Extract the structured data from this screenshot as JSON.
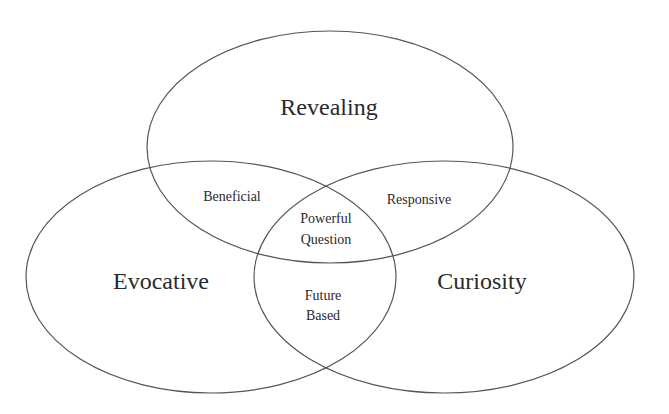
{
  "diagram": {
    "type": "venn",
    "stroke_color": "#555555",
    "text_color": "#2a2a2a",
    "sets": [
      {
        "id": "revealing",
        "label": "Revealing"
      },
      {
        "id": "evocative",
        "label": "Evocative"
      },
      {
        "id": "curiosity",
        "label": "Curiosity"
      }
    ],
    "intersections": {
      "revealing_evocative": "Beneficial",
      "revealing_curiosity": "Responsive",
      "evocative_curiosity": [
        "Future",
        "Based"
      ],
      "all_three": [
        "Powerful",
        "Question"
      ]
    }
  }
}
